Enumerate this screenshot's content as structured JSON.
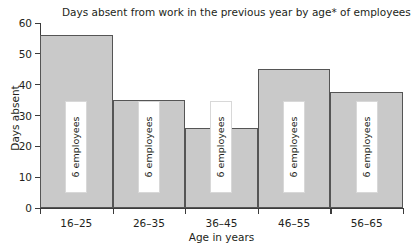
{
  "chart_data": {
    "type": "bar",
    "title": "Days absent from work in the previous year by age* of employees",
    "xlabel": "Age in years",
    "ylabel": "Days absent",
    "categories": [
      "16–25",
      "26–35",
      "36–45",
      "46–55",
      "56–65"
    ],
    "values": [
      56,
      35,
      26,
      45,
      37.5
    ],
    "bar_labels": [
      "6 employees",
      "6 employees",
      "6 employees",
      "6 employees",
      "6 employees"
    ],
    "ylim": [
      0,
      60
    ],
    "yticks": [
      0,
      10,
      20,
      30,
      40,
      50,
      60
    ],
    "ytick_labels": [
      "0",
      "10",
      "20",
      "30",
      "40",
      "50",
      "60"
    ],
    "grid": false,
    "legend": false,
    "bar_fill_color": "#c9c9c9",
    "bar_edge_color": "#555555",
    "axis_color": "#3b3b3b",
    "text_color": "#231f20",
    "background_color": "#ffffff"
  }
}
